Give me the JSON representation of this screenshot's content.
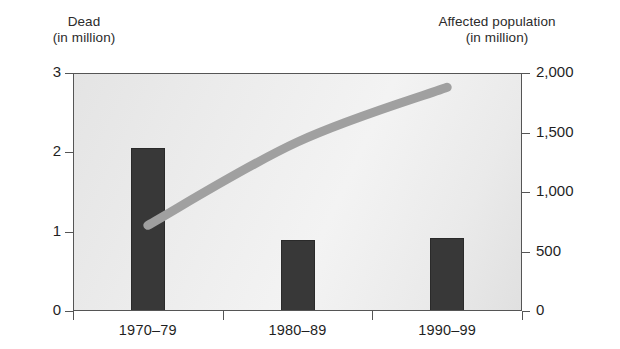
{
  "chart_data": {
    "type": "bar",
    "title": "",
    "subtitle": "",
    "categories": [
      "1970–79",
      "1980–89",
      "1990–99"
    ],
    "xlabel": "",
    "ylabel": "Dead (in million)",
    "y2label": "Affected population (in million)",
    "ylim": [
      0,
      3
    ],
    "y2lim": [
      0,
      2000
    ],
    "grid": false,
    "legend_position": "none",
    "series": [
      {
        "name": "Dead",
        "type": "bar",
        "axis": "left",
        "unit": "million",
        "color": "#383838",
        "values": [
          2.05,
          0.89,
          0.92
        ]
      },
      {
        "name": "Affected population",
        "type": "line",
        "axis": "right",
        "unit": "million",
        "color": "#a0a0a0",
        "values": [
          720,
          1420,
          1880
        ]
      }
    ],
    "yticks": [
      "0",
      "1",
      "2",
      "3"
    ],
    "ytick_values": [
      0,
      1,
      2,
      3
    ],
    "y2ticks": [
      "0",
      "500",
      "1,000",
      "1,500",
      "2,000"
    ],
    "y2tick_values": [
      0,
      500,
      1000,
      1500,
      2000
    ]
  },
  "labels": {
    "left_axis_title_line1": "Dead",
    "left_axis_title_line2": "(in million)",
    "right_axis_title_line1": "Affected population",
    "right_axis_title_line2": "(in million)"
  },
  "colors": {
    "bar": "#383838",
    "line": "#a0a0a0",
    "plot_background": "#ececec",
    "axis": "#555555",
    "text": "#1f1f1f"
  }
}
